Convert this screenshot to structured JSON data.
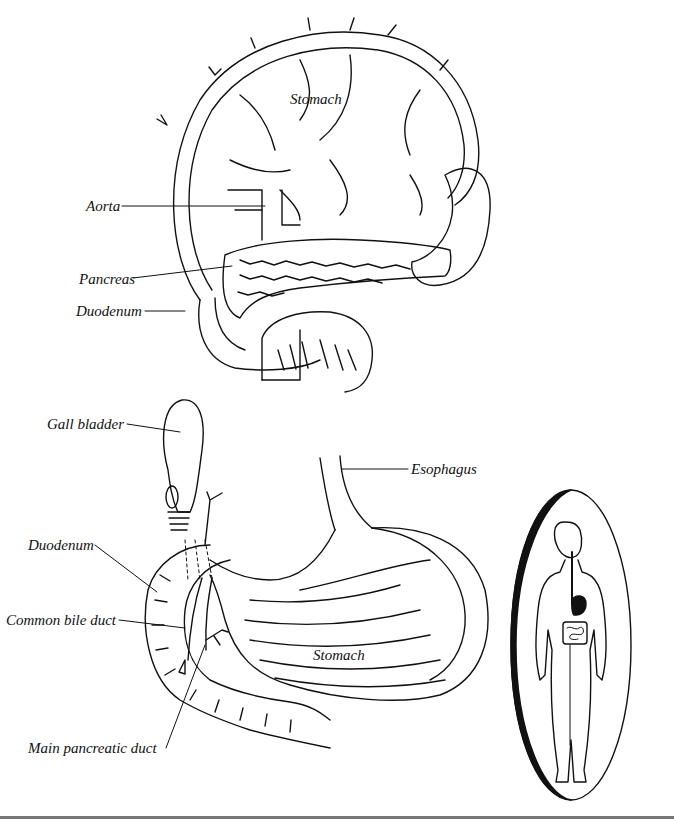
{
  "figure": {
    "top_panel": {
      "name": "Posterior view of stomach with pancreas",
      "labels": {
        "stomach": "Stomach",
        "aorta": "Aorta",
        "pancreas": "Pancreas",
        "duodenum": "Duodenum"
      }
    },
    "bottom_panel": {
      "name": "Stomach, duodenum and biliary ducts",
      "labels": {
        "gall_bladder": "Gall bladder",
        "esophagus": "Esophagus",
        "duodenum": "Duodenum",
        "common_bile_duct": "Common bile duct",
        "stomach": "Stomach",
        "main_pancreatic_duct": "Main pancreatic duct"
      }
    },
    "inset": {
      "name": "Human body silhouette showing digestive tract",
      "highlight": "stomach"
    },
    "colors": {
      "line": "#111111",
      "background": "#ffffff",
      "rule": "#777777"
    }
  }
}
